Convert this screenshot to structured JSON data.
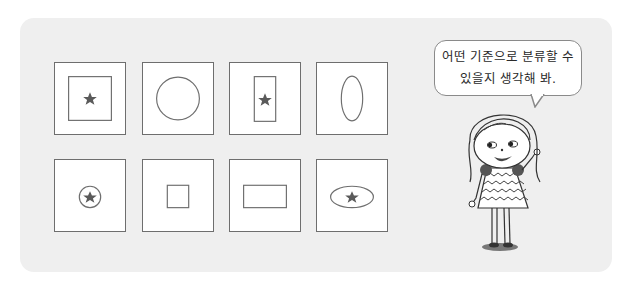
{
  "speech_bubble": {
    "line1": "어떤 기준으로 분류할 수",
    "line2": "있을지 생각해 봐."
  },
  "cards": [
    {
      "row": 1,
      "col": 1,
      "outer": "square",
      "inner": "square",
      "star": true
    },
    {
      "row": 1,
      "col": 2,
      "outer": "square",
      "inner": "circle",
      "star": false
    },
    {
      "row": 1,
      "col": 3,
      "outer": "square",
      "inner": "tall-rectangle",
      "star": true
    },
    {
      "row": 1,
      "col": 4,
      "outer": "square",
      "inner": "tall-ellipse",
      "star": false
    },
    {
      "row": 2,
      "col": 1,
      "outer": "square",
      "inner": "small-circle",
      "star": true
    },
    {
      "row": 2,
      "col": 2,
      "outer": "square",
      "inner": "small-square",
      "star": false
    },
    {
      "row": 2,
      "col": 3,
      "outer": "square",
      "inner": "wide-rectangle",
      "star": false
    },
    {
      "row": 2,
      "col": 4,
      "outer": "square",
      "inner": "wide-ellipse",
      "star": true
    }
  ],
  "colors": {
    "panel": "#efefef",
    "stroke": "#6e6e6e",
    "star": "#5a5a5a"
  }
}
